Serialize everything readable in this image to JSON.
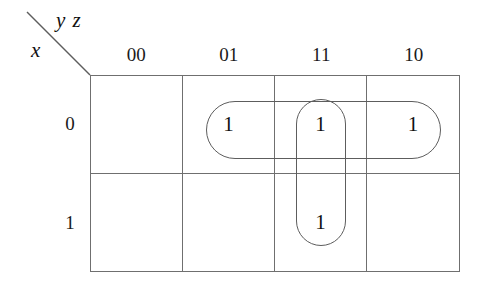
{
  "figure": {
    "type": "karnaugh-map",
    "variables": {
      "column_vars": "y z",
      "row_var": "x"
    }
  },
  "headers": {
    "columns": [
      "00",
      "01",
      "11",
      "10"
    ],
    "rows": [
      "0",
      "1"
    ]
  },
  "cells": [
    {
      "row": "0",
      "col": "00",
      "value": ""
    },
    {
      "row": "0",
      "col": "01",
      "value": "1"
    },
    {
      "row": "0",
      "col": "11",
      "value": "1"
    },
    {
      "row": "0",
      "col": "10",
      "value": "1"
    },
    {
      "row": "1",
      "col": "00",
      "value": ""
    },
    {
      "row": "1",
      "col": "01",
      "value": ""
    },
    {
      "row": "1",
      "col": "11",
      "value": "1"
    },
    {
      "row": "1",
      "col": "10",
      "value": ""
    }
  ],
  "groups": [
    {
      "name": "horizontal-group",
      "orientation": "horizontal",
      "covers": [
        "0/01",
        "0/11",
        "0/10"
      ]
    },
    {
      "name": "vertical-group",
      "orientation": "vertical",
      "covers": [
        "0/11",
        "1/11"
      ]
    }
  ],
  "colors": {
    "grid_line": "#6f6f6f",
    "group_stroke": "#5d5d5d",
    "text": "#111111",
    "background": "#ffffff"
  }
}
